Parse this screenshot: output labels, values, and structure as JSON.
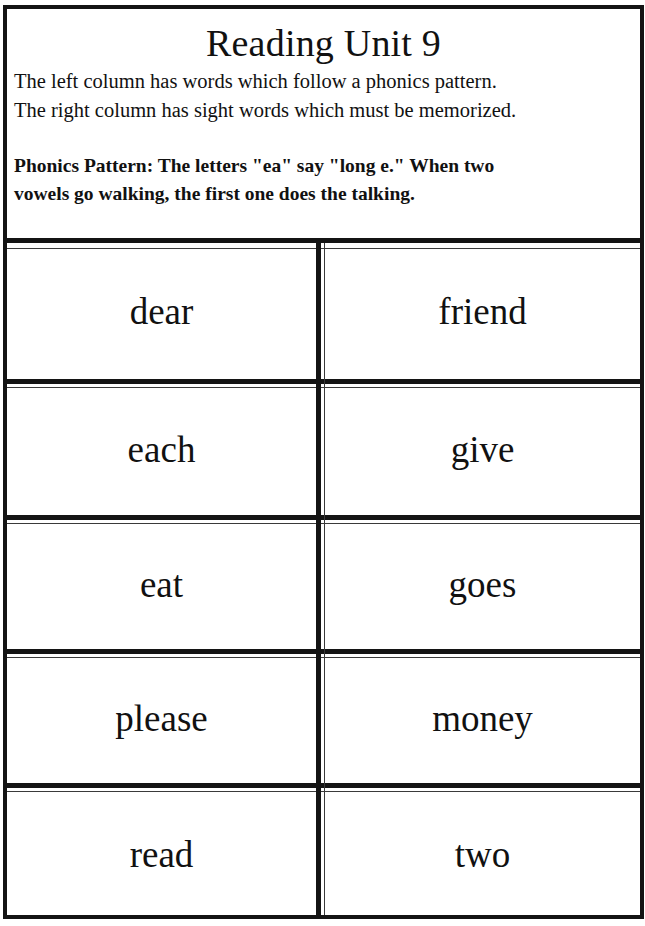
{
  "header": {
    "title": "Reading Unit 9",
    "intro_lines": [
      "The left column has words which follow a phonics pattern.",
      "The right column has sight words which must be memorized."
    ],
    "pattern_lines": [
      "Phonics Pattern:  The letters \"ea\" say \"long e.\"  When two",
      "vowels go walking, the first one does the talking."
    ]
  },
  "columns": {
    "left_description": "phonics pattern words",
    "right_description": "sight words"
  },
  "rows": [
    {
      "phonics": "dear",
      "sight": "friend"
    },
    {
      "phonics": "each",
      "sight": "give"
    },
    {
      "phonics": "eat",
      "sight": "goes"
    },
    {
      "phonics": "please",
      "sight": "money"
    },
    {
      "phonics": "read",
      "sight": "two"
    }
  ]
}
